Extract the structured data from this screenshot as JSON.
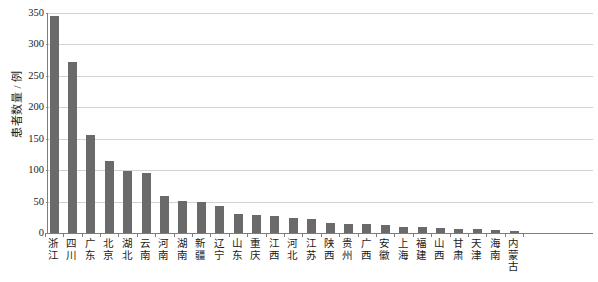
{
  "chart_data": {
    "type": "bar",
    "title": "",
    "xlabel": "",
    "ylabel": "患者数量 / 例",
    "ylim": [
      0,
      350
    ],
    "y_ticks": [
      0,
      50,
      100,
      150,
      200,
      250,
      300,
      350
    ],
    "grid": true,
    "legend": "none",
    "bar_color": "#6a6a6a",
    "gridline_color": "#d2d2d2",
    "axis_color": "#7d7d7d",
    "text_color": "#1a1a1a",
    "categories": [
      "浙江",
      "四川",
      "广东",
      "北京",
      "湖北",
      "云南",
      "河南",
      "湖南",
      "新疆",
      "辽宁",
      "山东",
      "重庆",
      "江西",
      "河北",
      "江苏",
      "陕西",
      "贵州",
      "广西",
      "安徽",
      "上海",
      "福建",
      "山西",
      "甘肃",
      "天津",
      "海南",
      "内蒙古"
    ],
    "values": [
      345,
      272,
      156,
      114,
      99,
      95,
      59,
      51,
      49,
      43,
      30,
      29,
      27,
      24,
      22,
      16,
      15,
      14,
      13,
      10,
      9,
      8,
      7,
      6,
      5,
      4
    ]
  }
}
